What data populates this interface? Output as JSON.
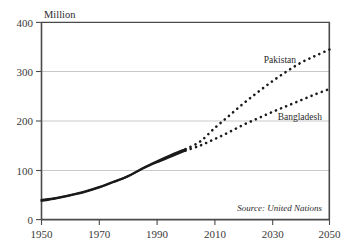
{
  "chart_data": {
    "type": "line",
    "title": "",
    "subtitle": "",
    "xlabel": "",
    "ylabel": "Million",
    "xlim": [
      1950,
      2050
    ],
    "ylim": [
      0,
      400
    ],
    "grid": "horizontal",
    "legend_position": "inline-labels",
    "xticks": [
      "1950",
      "1970",
      "1990",
      "2010",
      "2030",
      "2050"
    ],
    "xtick_values": [
      1950,
      1970,
      1990,
      2010,
      2030,
      2050
    ],
    "yticks": [
      "0",
      "100",
      "200",
      "300",
      "400"
    ],
    "ytick_values": [
      0,
      100,
      200,
      300,
      400
    ],
    "x": [
      1950,
      1955,
      1960,
      1965,
      1970,
      1975,
      1980,
      1985,
      1990,
      1995,
      2000,
      2005,
      2010,
      2015,
      2020,
      2025,
      2030,
      2035,
      2040,
      2045,
      2050
    ],
    "series": [
      {
        "name": "Pakistan",
        "values": [
          40,
          44,
          50,
          57,
          66,
          77,
          88,
          104,
          118,
          131,
          143,
          158,
          185,
          210,
          235,
          258,
          280,
          300,
          318,
          332,
          345
        ],
        "solid_until": 2000,
        "style_historical": "solid",
        "style_projection": "dotted",
        "color": "#1a1a1a",
        "label_text": "Pakistan"
      },
      {
        "name": "Bangladesh",
        "values": [
          38,
          43,
          49,
          56,
          65,
          76,
          88,
          103,
          116,
          128,
          140,
          150,
          163,
          177,
          192,
          205,
          218,
          230,
          242,
          254,
          265
        ],
        "solid_until": 2000,
        "style_historical": "solid",
        "style_projection": "dotted",
        "color": "#1a1a1a",
        "label_text": "Bangladesh"
      }
    ],
    "annotations": [
      {
        "text": "Source: United Nations",
        "style": "italic"
      }
    ]
  },
  "axis": {
    "y_unit": "Million"
  },
  "labels": {
    "pakistan": "Pakistan",
    "bangladesh": "Bangladesh"
  },
  "source": {
    "text": "Source: United Nations"
  },
  "colors": {
    "line": "#1a1a1a",
    "grid": "#c9c9c9",
    "frame": "#4a4a4a",
    "text": "#2a2a2a",
    "background": "#ffffff"
  }
}
